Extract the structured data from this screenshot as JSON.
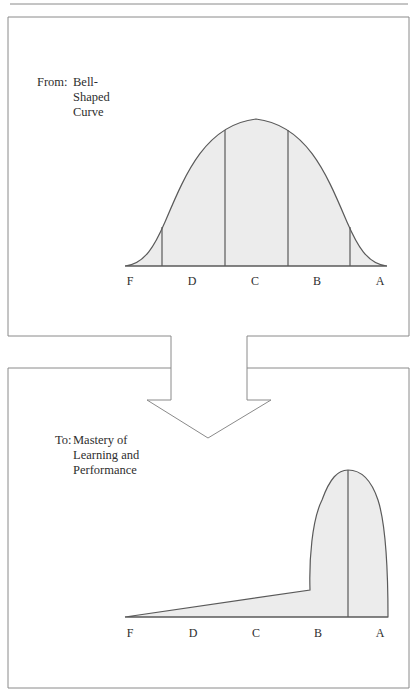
{
  "figure": {
    "colors": {
      "stroke": "#5a5a5a",
      "frame": "#8a8a8a",
      "fill": "#ececec",
      "background": "#ffffff"
    },
    "top_panel": {
      "caption_prefix": "From:",
      "caption_lines": [
        "Bell-",
        "Shaped",
        "Curve"
      ],
      "curve_type": "bell-shaped (normal distribution)",
      "grade_labels": [
        "F",
        "D",
        "C",
        "B",
        "A"
      ]
    },
    "arrow": {
      "direction": "down",
      "meaning": "transition from bell-shaped curve to mastery curve"
    },
    "bottom_panel": {
      "caption_prefix": "To:",
      "caption_lines": [
        "Mastery of",
        "Learning and",
        "Performance"
      ],
      "curve_type": "skewed mastery distribution (concentrated at A/B)",
      "grade_labels": [
        "F",
        "D",
        "C",
        "B",
        "A"
      ]
    }
  }
}
